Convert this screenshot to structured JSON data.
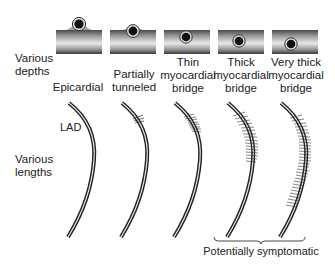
{
  "figure": {
    "row_labels": {
      "depths": [
        "Various",
        "depths"
      ],
      "lengths": [
        "Various",
        "lengths"
      ]
    },
    "columns": [
      {
        "id": "epicardial",
        "label_lines": [
          "Epicardial"
        ],
        "bridge": "none"
      },
      {
        "id": "partially-tunneled",
        "label_lines": [
          "Partially",
          "tunneled"
        ],
        "bridge": "partial"
      },
      {
        "id": "thin-bridge",
        "label_lines": [
          "Thin",
          "myocardial",
          "bridge"
        ],
        "bridge": "thin"
      },
      {
        "id": "thick-bridge",
        "label_lines": [
          "Thick",
          "myocardial",
          "bridge"
        ],
        "bridge": "thick"
      },
      {
        "id": "very-thick-bridge",
        "label_lines": [
          "Very thick",
          "myocardial",
          "bridge"
        ],
        "bridge": "very-thick"
      }
    ],
    "artery_label": "LAD",
    "bracket_label": "Potentially symptomatic",
    "colors": {
      "vessel_outline": "#222222",
      "lumen": "#111111",
      "muscle_dark": "#555555",
      "muscle_light": "#e6e6e6",
      "text": "#222222"
    }
  }
}
